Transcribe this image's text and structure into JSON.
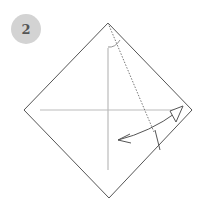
{
  "step": {
    "number": "2",
    "badge_color": "#d3d3d3",
    "text_color": "#555555"
  },
  "diagram": {
    "shape": "square-diamond",
    "vertices": {
      "top": [
        108,
        23
      ],
      "right": [
        192,
        110
      ],
      "bottom": [
        109,
        198
      ],
      "left": [
        24,
        110
      ]
    },
    "outline_color": "#555555",
    "crease_color": "#bbbbbb",
    "valley_fold_line": "dotted",
    "arrow": "fold-and-unfold"
  }
}
